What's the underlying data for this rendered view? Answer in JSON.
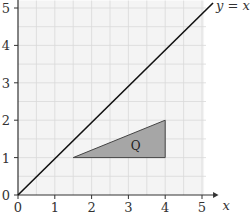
{
  "chart_data": {
    "type": "line",
    "title": "",
    "xlabel": "x",
    "ylabel": "",
    "xlim": [
      0,
      5.5
    ],
    "ylim": [
      0,
      5.2
    ],
    "grid": true,
    "grid_minor_step": 0.5,
    "x_ticks": [
      "0",
      "1",
      "2",
      "3",
      "4",
      "5"
    ],
    "y_ticks": [
      "0",
      "1",
      "2",
      "3",
      "4",
      "5"
    ],
    "series": [
      {
        "name": "y = x",
        "type": "line",
        "points": [
          [
            0,
            0
          ],
          [
            5.3,
            5.3
          ]
        ],
        "label": "y = x",
        "color": "#111111"
      }
    ],
    "shapes": [
      {
        "name": "Q",
        "type": "triangle",
        "vertices": [
          [
            1.5,
            1
          ],
          [
            4,
            1
          ],
          [
            4,
            2
          ]
        ],
        "fill": "#a6a6a6",
        "label": "Q"
      }
    ]
  },
  "labels": {
    "line_label": "y = x",
    "x_axis_label": "x",
    "shape_label": "Q"
  },
  "colors": {
    "grid_fill": "#f4f4f4",
    "grid_line": "#d9d9d9",
    "axis": "#333333",
    "triangle_fill": "#a6a6a6",
    "line": "#111111"
  }
}
